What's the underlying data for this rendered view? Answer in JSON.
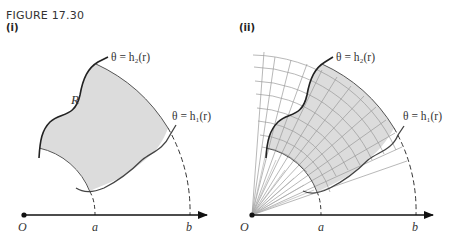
{
  "figure": {
    "title": "FIGURE 17.30",
    "panels": [
      {
        "label": "(i)",
        "region_label": "R",
        "upper_curve_label": "θ = h₂(r)",
        "lower_curve_label": "θ = h₁(r)",
        "axis": {
          "origin": "O",
          "inner_radius": "a",
          "outer_radius": "b"
        }
      },
      {
        "label": "(ii)",
        "upper_curve_label": "θ = h₂(r)",
        "lower_curve_label": "θ = h₁(r)",
        "axis": {
          "origin": "O",
          "inner_radius": "a",
          "outer_radius": "b"
        },
        "grid": "polar partition of annular sector"
      }
    ]
  }
}
